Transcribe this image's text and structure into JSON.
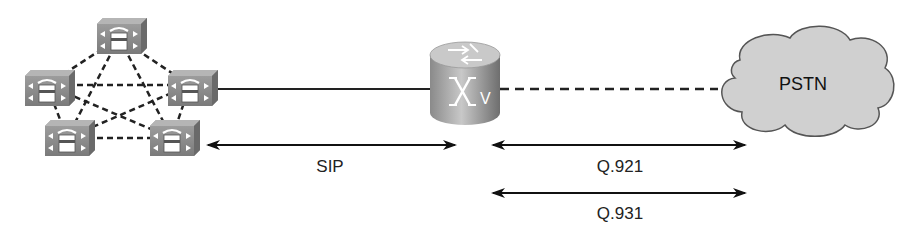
{
  "diagram": {
    "type": "network-topology",
    "nodes": [
      {
        "id": "phone-top",
        "kind": "ip-phone-gateway",
        "x": 97,
        "y": 18
      },
      {
        "id": "phone-left",
        "kind": "ip-phone-gateway",
        "x": 25,
        "y": 70
      },
      {
        "id": "phone-right",
        "kind": "ip-phone-gateway",
        "x": 168,
        "y": 70
      },
      {
        "id": "phone-bottom-left",
        "kind": "ip-phone-gateway",
        "x": 45,
        "y": 120
      },
      {
        "id": "phone-bottom-right",
        "kind": "ip-phone-gateway",
        "x": 150,
        "y": 120
      },
      {
        "id": "voice-router",
        "kind": "voice-router"
      },
      {
        "id": "pstn",
        "kind": "cloud",
        "label": "PSTN"
      }
    ],
    "links": [
      {
        "from": "phone-right",
        "to": "voice-router",
        "style": "solid"
      },
      {
        "from": "voice-router",
        "to": "pstn",
        "style": "dashed"
      }
    ],
    "protocol_labels": {
      "sip": "SIP",
      "q921": "Q.921",
      "q931": "Q.931"
    },
    "cloud_label": "PSTN",
    "router_badge": "V"
  }
}
